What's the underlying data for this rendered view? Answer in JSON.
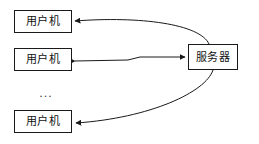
{
  "diagram": {
    "background_color": "#ffffff",
    "line_color": "#1a1a1a",
    "box_fill_color": "#ffffff",
    "nodes": [
      {
        "id": "client-1",
        "label": "用户机",
        "role": "client"
      },
      {
        "id": "client-2",
        "label": "用户机",
        "role": "client"
      },
      {
        "id": "client-3",
        "label": "用户机",
        "role": "client"
      },
      {
        "id": "server",
        "label": "服务器",
        "role": "server"
      }
    ],
    "ellipsis": {
      "label": "...",
      "meaning": "additional clients omitted"
    },
    "edges": [
      {
        "id": "edge-client1",
        "from": "server",
        "to": "client-1",
        "style": "curved",
        "direction": "both"
      },
      {
        "id": "edge-client2",
        "from": "client-2",
        "to": "server",
        "style": "stepped",
        "direction": "both"
      },
      {
        "id": "edge-client3",
        "from": "server",
        "to": "client-3",
        "style": "curved",
        "direction": "both"
      }
    ]
  }
}
